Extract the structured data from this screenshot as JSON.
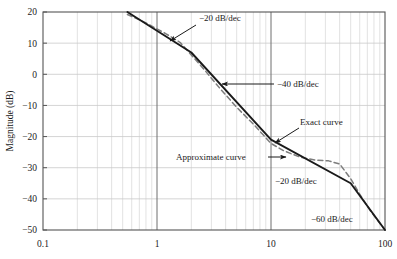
{
  "chart_data": {
    "type": "line",
    "title": "",
    "xlabel": "",
    "ylabel": "Magnitude (dB)",
    "xscale": "log",
    "xlim": [
      0.1,
      100
    ],
    "ylim": [
      -50,
      20
    ],
    "grid": true,
    "legend_position": "none",
    "xticks": [
      "0.1",
      "1",
      "10",
      "100"
    ],
    "xtick_values": [
      0.1,
      1,
      10,
      100
    ],
    "yticks": [
      "20",
      "10",
      "0",
      "−10",
      "−20",
      "−30",
      "−40",
      "−50"
    ],
    "ytick_values": [
      20,
      10,
      0,
      -10,
      -20,
      -30,
      -40,
      -50
    ],
    "series": [
      {
        "name": "Approximate curve",
        "style": "solid",
        "color": "#1a1a1a",
        "x": [
          0.55,
          2,
          10,
          50,
          100
        ],
        "values": [
          20,
          7,
          -21,
          -35,
          -50
        ],
        "breakpoints": [
          {
            "w": 0.55,
            "mag": 20,
            "slope_after": -20
          },
          {
            "w": 2,
            "mag": 7,
            "slope_after": -40
          },
          {
            "w": 10,
            "mag": -21,
            "slope_after": -20
          },
          {
            "w": 50,
            "mag": -35,
            "slope_after": -60
          },
          {
            "w": 100,
            "mag": -50,
            "slope_after": null
          }
        ]
      },
      {
        "name": "Exact curve",
        "style": "dashed",
        "color": "#7d7d7d",
        "x": [
          0.55,
          0.8,
          1.2,
          1.6,
          2,
          2.6,
          3.5,
          5,
          7,
          10,
          13,
          18,
          25,
          32,
          40,
          50,
          60,
          75,
          100
        ],
        "values": [
          19.2,
          16.5,
          13.0,
          10.2,
          6.2,
          1.5,
          -4.2,
          -10.6,
          -16.0,
          -22.2,
          -24.6,
          -26.6,
          -27.6,
          -27.8,
          -28.8,
          -33.5,
          -38.5,
          -44.0,
          -50.0
        ]
      }
    ],
    "annotations": [
      {
        "id": "slope-20-upper",
        "text": "−20 dB/dec",
        "x": 199,
        "y": 21,
        "arrow": {
          "x1": 196,
          "y1": 25,
          "x2": 170,
          "y2": 41
        }
      },
      {
        "id": "slope-40",
        "text": "−40 dB/dec",
        "x": 277,
        "y": 87,
        "arrow": {
          "x1": 274,
          "y1": 84,
          "x2": 222,
          "y2": 84
        }
      },
      {
        "id": "exact-curve",
        "text": "Exact curve",
        "x": 300,
        "y": 125,
        "arrow": {
          "x1": 299,
          "y1": 128,
          "x2": 275,
          "y2": 143
        }
      },
      {
        "id": "approximate-curve",
        "text": "Approximate curve",
        "x": 176,
        "y": 160,
        "arrow": {
          "x1": 268,
          "y1": 157,
          "x2": 286,
          "y2": 157
        }
      },
      {
        "id": "slope-20-lower",
        "text": "−20 dB/dec",
        "x": 275,
        "y": 184,
        "arrow": null
      },
      {
        "id": "slope-60",
        "text": "−60 dB/dec",
        "x": 311,
        "y": 222,
        "arrow": null
      }
    ]
  },
  "axes": {
    "y_axis_title": "Magnitude (dB)"
  }
}
